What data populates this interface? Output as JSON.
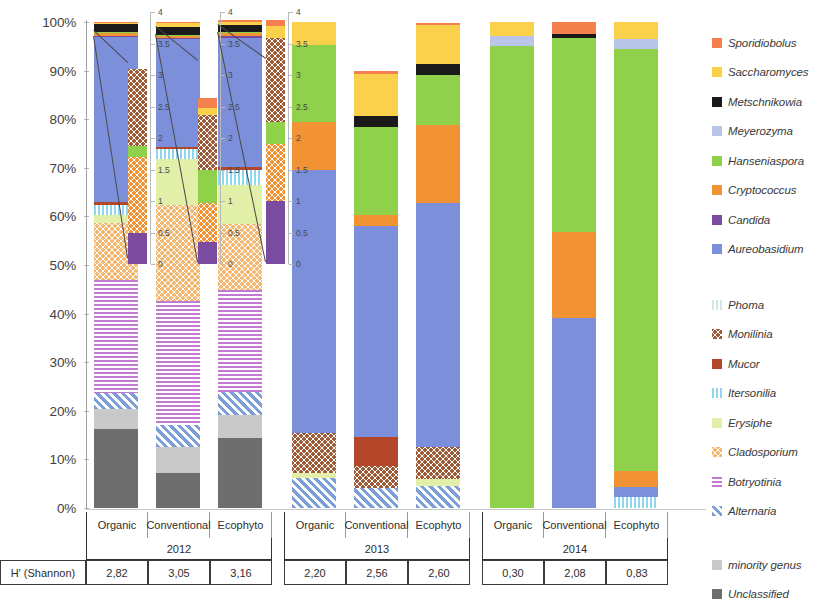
{
  "yaxis": {
    "ticks": [
      "100%",
      "90%",
      "80%",
      "70%",
      "60%",
      "50%",
      "40%",
      "30%",
      "20%",
      "10%",
      "0%"
    ]
  },
  "inset_axis": {
    "ticks": [
      "4",
      "3.5",
      "3",
      "2.5",
      "2",
      "1.5",
      "1",
      "0.5",
      "0"
    ]
  },
  "legend": {
    "groupA": [
      {
        "label": "Sporidiobolus",
        "color": "#f4804e",
        "pattern": "solid"
      },
      {
        "label": "Saccharomyces",
        "color": "#fbd14b",
        "pattern": "solid"
      },
      {
        "label": "Metschnikowia",
        "color": "#1a1a1a",
        "pattern": "solid"
      },
      {
        "label": "Meyerozyma",
        "color": "#b9c6ea",
        "pattern": "solid"
      },
      {
        "label": "Hanseniaspora",
        "color": "#8fd14a",
        "pattern": "solid"
      },
      {
        "label": "Cryptococcus",
        "color": "#f19234",
        "pattern": "solid"
      },
      {
        "label": "Candida",
        "color": "#7a4b9e",
        "pattern": "solid"
      },
      {
        "label": "Aureobasidium",
        "color": "#7b8fda",
        "pattern": "solid"
      }
    ],
    "groupB": [
      {
        "label": "Phoma",
        "color": "#cfe8e4",
        "pattern": "vlines"
      },
      {
        "label": "Monilinia",
        "color": "#9c5a36",
        "pattern": "dots"
      },
      {
        "label": "Mucor",
        "color": "#b4462a",
        "pattern": "solid"
      },
      {
        "label": "Itersonilia",
        "color": "#8fd6f0",
        "pattern": "vlines"
      },
      {
        "label": "Erysiphe",
        "color": "#e2efa8",
        "pattern": "solid"
      },
      {
        "label": "Cladosporium",
        "color": "#f5b870",
        "pattern": "dots"
      },
      {
        "label": "Botryotinia",
        "color": "#c07bd1",
        "pattern": "hlines"
      },
      {
        "label": "Alternaria",
        "color": "#7b9fd6",
        "pattern": "diag"
      }
    ],
    "groupC": [
      {
        "label": "minority genus",
        "color": "#c9c9c9",
        "pattern": "solid"
      },
      {
        "label": "Unclassified",
        "color": "#6e6e6e",
        "pattern": "solid"
      }
    ]
  },
  "table": {
    "row_header": "H' (Shannon)",
    "treatments": [
      "Organic",
      "Conventional",
      "Ecophyto",
      "Organic",
      "Conventional",
      "Ecophyto",
      "Organic",
      "Conventional",
      "Ecophyto"
    ],
    "years": [
      "2012",
      "2013",
      "2014"
    ],
    "shannon": [
      "2,82",
      "3,05",
      "3,16",
      "2,20",
      "2,56",
      "2,60",
      "0,30",
      "2,08",
      "0,83"
    ]
  },
  "chart_data": {
    "type": "bar",
    "title": "",
    "xlabel": "",
    "ylabel": "",
    "ylim": [
      0,
      100
    ],
    "stacked": true,
    "normalized_percent": true,
    "grid": false,
    "legend_position": "right",
    "categories": [
      "Organic 2012",
      "Conventional 2012",
      "Ecophyto 2012",
      "Organic 2013",
      "Conventional 2013",
      "Ecophyto 2013",
      "Organic 2014",
      "Conventional 2014",
      "Ecophyto 2014"
    ],
    "series": [
      {
        "name": "Unclassified",
        "color": "#6e6e6e",
        "pattern": "solid",
        "values": [
          16.3,
          7.2,
          14.4,
          0,
          0,
          0,
          0,
          0,
          0
        ]
      },
      {
        "name": "minority genus",
        "color": "#c9c9c9",
        "pattern": "solid",
        "values": [
          4.0,
          5.3,
          4.8,
          0,
          0,
          0,
          0,
          0,
          0
        ]
      },
      {
        "name": "Alternaria",
        "color": "#7b9fd6",
        "pattern": "diag",
        "values": [
          3.4,
          4.5,
          4.6,
          6.2,
          4.1,
          4.6,
          0,
          0,
          0
        ]
      },
      {
        "name": "Botryotinia",
        "color": "#c07bd1",
        "pattern": "hlines",
        "values": [
          23.3,
          25.6,
          21.0,
          0,
          0,
          0,
          0,
          0,
          0
        ]
      },
      {
        "name": "Cladosporium",
        "color": "#f5b870",
        "pattern": "dots",
        "values": [
          11.6,
          19.8,
          13.6,
          0,
          0,
          0,
          0,
          0,
          0
        ]
      },
      {
        "name": "Erysiphe",
        "color": "#e2efa8",
        "pattern": "solid",
        "values": [
          1.6,
          9.4,
          8.1,
          1.1,
          0,
          1.4,
          0,
          0,
          0
        ]
      },
      {
        "name": "Itersonilia",
        "color": "#8fd6f0",
        "pattern": "vlines",
        "values": [
          2.1,
          2.0,
          3.0,
          0,
          0,
          0,
          0,
          0,
          2.3
        ]
      },
      {
        "name": "Monilinia",
        "color": "#9c5a36",
        "pattern": "dots",
        "values": [
          0,
          0,
          0,
          8.2,
          4.5,
          6.6,
          0,
          0,
          0
        ]
      },
      {
        "name": "Mucor",
        "color": "#b4462a",
        "pattern": "solid",
        "values": [
          0.6,
          0.5,
          0.7,
          0,
          6.0,
          0,
          0,
          0,
          0
        ]
      },
      {
        "name": "Aureobasidium",
        "color": "#7b8fda",
        "pattern": "solid",
        "values": [
          34.0,
          22.3,
          26.5,
          54.0,
          43.4,
          50.2,
          0,
          39.2,
          2.0
        ]
      },
      {
        "name": "Candida",
        "color": "#7a4b9e",
        "pattern": "solid",
        "values": [
          0.3,
          0.2,
          0.5,
          0,
          0,
          0,
          0,
          0,
          0
        ]
      },
      {
        "name": "Cryptococcus",
        "color": "#f19234",
        "pattern": "solid",
        "values": [
          0.6,
          0.3,
          0.5,
          10.0,
          2.2,
          16.0,
          0,
          17.5,
          3.4
        ]
      },
      {
        "name": "Hanseniaspora",
        "color": "#8fd14a",
        "pattern": "solid",
        "values": [
          0.1,
          0.3,
          0.2,
          15.8,
          18.2,
          10.2,
          95.0,
          40.0,
          86.8
        ]
      },
      {
        "name": "Meyerozyma",
        "color": "#b9c6ea",
        "pattern": "solid",
        "values": [
          0,
          0,
          0,
          0,
          0,
          0,
          2.2,
          0,
          2.1
        ]
      },
      {
        "name": "Metschnikowia",
        "color": "#1a1a1a",
        "pattern": "solid",
        "values": [
          1.6,
          1.5,
          1.5,
          0,
          2.2,
          2.4,
          0,
          0.8,
          0
        ]
      },
      {
        "name": "Saccharomyces",
        "color": "#fbd14b",
        "pattern": "solid",
        "values": [
          0.3,
          0.8,
          0.7,
          4.7,
          8.7,
          8.0,
          2.8,
          0,
          3.4
        ]
      },
      {
        "name": "Sporidiobolus",
        "color": "#f4804e",
        "pattern": "solid",
        "values": [
          0.2,
          0.3,
          0.4,
          0,
          0.7,
          0.5,
          0,
          2.5,
          0
        ]
      }
    ],
    "insets": [
      {
        "for": "Organic 2012",
        "ylim": [
          0,
          4
        ],
        "stack": [
          {
            "name": "Candida",
            "color": "#7a4b9e",
            "pattern": "solid",
            "value": 0.5
          },
          {
            "name": "Cryptococcus",
            "color": "#f19234",
            "pattern": "dots",
            "value": 1.2
          },
          {
            "name": "Hanseniaspora",
            "color": "#8fd14a",
            "pattern": "solid",
            "value": 0.18
          },
          {
            "name": "Mucor",
            "color": "#9c5a36",
            "pattern": "dots",
            "value": 1.22
          }
        ]
      },
      {
        "for": "Conventional 2012",
        "ylim": [
          0,
          4
        ],
        "stack": [
          {
            "name": "Candida",
            "color": "#7a4b9e",
            "pattern": "solid",
            "value": 0.35
          },
          {
            "name": "Cryptococcus",
            "color": "#f19234",
            "pattern": "dots",
            "value": 0.62
          },
          {
            "name": "Hanseniaspora",
            "color": "#8fd14a",
            "pattern": "solid",
            "value": 0.52
          },
          {
            "name": "Mucor",
            "color": "#9c5a36",
            "pattern": "dots",
            "value": 0.88
          },
          {
            "name": "Saccharomyces",
            "color": "#fbd14b",
            "pattern": "solid",
            "value": 0.1
          },
          {
            "name": "Sporidiobolus",
            "color": "#f4804e",
            "pattern": "solid",
            "value": 0.16
          }
        ]
      },
      {
        "for": "Ecophyto 2012",
        "ylim": [
          0,
          4
        ],
        "stack": [
          {
            "name": "Candida",
            "color": "#7a4b9e",
            "pattern": "solid",
            "value": 1.0
          },
          {
            "name": "Cryptococcus",
            "color": "#f19234",
            "pattern": "dots",
            "value": 0.9
          },
          {
            "name": "Hanseniaspora",
            "color": "#8fd14a",
            "pattern": "solid",
            "value": 0.36
          },
          {
            "name": "Mucor",
            "color": "#9c5a36",
            "pattern": "dots",
            "value": 1.32
          },
          {
            "name": "Saccharomyces",
            "color": "#fbd14b",
            "pattern": "solid",
            "value": 0.2
          },
          {
            "name": "Sporidiobolus",
            "color": "#f4804e",
            "pattern": "solid",
            "value": 0.1
          }
        ]
      }
    ]
  }
}
